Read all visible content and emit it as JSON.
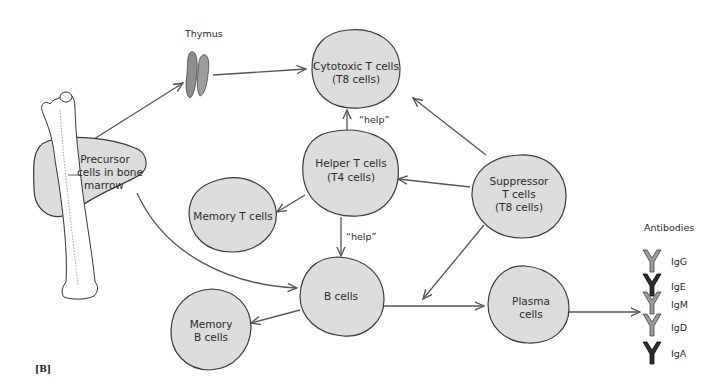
{
  "figure_label": "[B]",
  "nodes": {
    "thymus": {
      "label": "Thymus"
    },
    "precursor": {
      "line1": "Precursor",
      "line2": "cells in bone",
      "line3": "marrow"
    },
    "cytotoxic": {
      "line1": "Cytotoxic T cells",
      "line2": "(T8 cells)"
    },
    "helper": {
      "line1": "Helper T cells",
      "line2": "(T4 cells)"
    },
    "memory_t": {
      "line1": "Memory T cells"
    },
    "suppressor": {
      "line1": "Suppressor",
      "line2": "T cells",
      "line3": "(T8 cells)"
    },
    "b_cells": {
      "line1": "B cells"
    },
    "memory_b": {
      "line1": "Memory",
      "line2": "B cells"
    },
    "plasma": {
      "line1": "Plasma",
      "line2": "cells"
    }
  },
  "edge_labels": {
    "help_upper": "“help”",
    "help_lower": "“help”"
  },
  "antibodies": {
    "title": "Antibodies",
    "items": [
      {
        "name": "IgG",
        "shade": "light"
      },
      {
        "name": "IgE",
        "shade": "dark"
      },
      {
        "name": "IgM",
        "shade": "light"
      },
      {
        "name": "IgD",
        "shade": "light"
      },
      {
        "name": "IgA",
        "shade": "dark"
      }
    ]
  },
  "edges": [
    {
      "from": "precursor",
      "to": "thymus"
    },
    {
      "from": "thymus",
      "to": "cytotoxic"
    },
    {
      "from": "precursor",
      "to": "b_cells"
    },
    {
      "from": "helper",
      "to": "cytotoxic",
      "label": "help"
    },
    {
      "from": "helper",
      "to": "memory_t"
    },
    {
      "from": "helper",
      "to": "b_cells",
      "label": "help"
    },
    {
      "from": "suppressor",
      "to": "cytotoxic"
    },
    {
      "from": "suppressor",
      "to": "helper"
    },
    {
      "from": "suppressor",
      "to": "b_plasma_edge"
    },
    {
      "from": "b_cells",
      "to": "memory_b"
    },
    {
      "from": "b_cells",
      "to": "plasma"
    },
    {
      "from": "plasma",
      "to": "antibodies"
    }
  ]
}
